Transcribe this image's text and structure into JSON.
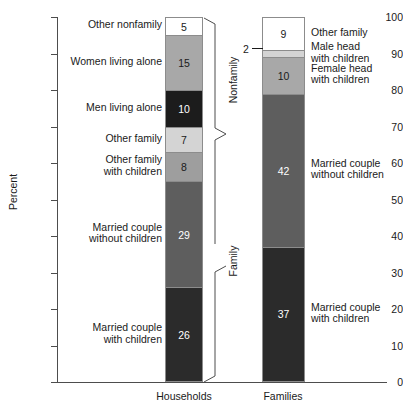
{
  "chart_data": {
    "type": "bar",
    "title": "",
    "subtitle": "",
    "xlabel": "",
    "ylabel": "Percent",
    "ylim": [
      0,
      100
    ],
    "yticks": [
      0,
      10,
      20,
      30,
      40,
      50,
      60,
      70,
      80,
      90,
      100
    ],
    "grid": false,
    "legend_position": "none",
    "stacked": true,
    "categories": [
      "Households",
      "Families"
    ],
    "series": [
      {
        "name": "Married couple with children",
        "values": [
          26,
          37
        ],
        "color": "#2b2b2b"
      },
      {
        "name": "Married couple without children",
        "values": [
          29,
          42
        ],
        "color": "#5e5e5e"
      },
      {
        "name": "Other family with children",
        "values": [
          8,
          null
        ],
        "color": "#9e9e9e"
      },
      {
        "name": "Other family",
        "values": [
          7,
          9
        ],
        "color": "#d4d4d4"
      },
      {
        "name": "Men living alone",
        "values": [
          10,
          null
        ],
        "color": "#1c1c1c"
      },
      {
        "name": "Women living alone",
        "values": [
          15,
          null
        ],
        "color": "#a8a8a8"
      },
      {
        "name": "Other nonfamily",
        "values": [
          5,
          null
        ],
        "color": "#ffffff"
      },
      {
        "name": "Female head with children",
        "values": [
          null,
          10
        ],
        "color": "#a8a8a8"
      },
      {
        "name": "Male head with children",
        "values": [
          null,
          2
        ],
        "color": "#d4d4d4"
      }
    ],
    "annotations": [
      "Nonfamily",
      "Family"
    ]
  },
  "axis": {
    "y_title": "Percent",
    "y_ticks": [
      "100",
      "90",
      "80",
      "70",
      "60",
      "50",
      "40",
      "30",
      "20",
      "10",
      "0"
    ]
  },
  "bars": {
    "households": {
      "label": "Households",
      "segments": [
        {
          "name": "other-nonfamily",
          "value": "5",
          "value_num": 5,
          "color": "#ffffff",
          "text_color": "#1a1a1a",
          "label": "Other nonfamily",
          "label_side": "left",
          "label_lines": [
            "Other nonfamily"
          ]
        },
        {
          "name": "women-living-alone",
          "value": "15",
          "value_num": 15,
          "color": "#a8a8a8",
          "text_color": "#1a1a1a",
          "label": "Women living alone",
          "label_side": "left",
          "label_lines": [
            "Women living alone"
          ]
        },
        {
          "name": "men-living-alone",
          "value": "10",
          "value_num": 10,
          "color": "#1c1c1c",
          "text_color": "#ffffff",
          "label": "Men living alone",
          "label_side": "left",
          "label_lines": [
            "Men living alone"
          ]
        },
        {
          "name": "other-family",
          "value": "7",
          "value_num": 7,
          "color": "#d4d4d4",
          "text_color": "#1a1a1a",
          "label": "Other family",
          "label_side": "left",
          "label_lines": [
            "Other family"
          ]
        },
        {
          "name": "other-family-with-children",
          "value": "8",
          "value_num": 8,
          "color": "#9e9e9e",
          "text_color": "#1a1a1a",
          "label": "Other family with children",
          "label_side": "left",
          "label_lines": [
            "Other family",
            "with children"
          ]
        },
        {
          "name": "married-couple-without-children",
          "value": "29",
          "value_num": 29,
          "color": "#5e5e5e",
          "text_color": "#ffffff",
          "label": "Married couple without children",
          "label_side": "left",
          "label_lines": [
            "Married couple",
            "without children"
          ]
        },
        {
          "name": "married-couple-with-children",
          "value": "26",
          "value_num": 26,
          "color": "#2b2b2b",
          "text_color": "#ffffff",
          "label": "Married couple with children",
          "label_side": "left",
          "label_lines": [
            "Married couple",
            "with children"
          ]
        }
      ]
    },
    "families": {
      "label": "Families",
      "segments": [
        {
          "name": "other-family",
          "value": "9",
          "value_num": 9,
          "color": "#ffffff",
          "text_color": "#1a1a1a",
          "label": "Other family",
          "label_side": "right",
          "label_lines": [
            "Other family"
          ]
        },
        {
          "name": "male-head-with-children",
          "value": "2",
          "value_num": 2,
          "color": "#d4d4d4",
          "text_color": "#1a1a1a",
          "label": "Male head with children",
          "label_side": "right",
          "label_lines": [
            "Male head",
            "with children"
          ]
        },
        {
          "name": "female-head-with-children",
          "value": "10",
          "value_num": 10,
          "color": "#a8a8a8",
          "text_color": "#1a1a1a",
          "label": "Female head with children",
          "label_side": "right",
          "label_lines": [
            "Female head",
            "with children"
          ]
        },
        {
          "name": "married-couple-without-children",
          "value": "42",
          "value_num": 42,
          "color": "#5e5e5e",
          "text_color": "#ffffff",
          "label": "Married couple without children",
          "label_side": "right",
          "label_lines": [
            "Married couple",
            "without children"
          ]
        },
        {
          "name": "married-couple-with-children",
          "value": "37",
          "value_num": 37,
          "color": "#2b2b2b",
          "text_color": "#ffffff",
          "label": "Married couple with children",
          "label_side": "right",
          "label_lines": [
            "Married couple",
            "with children"
          ]
        }
      ]
    }
  },
  "braces": {
    "nonfamily": "Nonfamily",
    "family": "Family"
  },
  "callouts": {
    "male_head_value": "2"
  },
  "colors": {
    "axis": "#4d4d4d",
    "text": "#1a1a1a",
    "segment_border": "#8c8c8c",
    "background": "#ffffff"
  }
}
